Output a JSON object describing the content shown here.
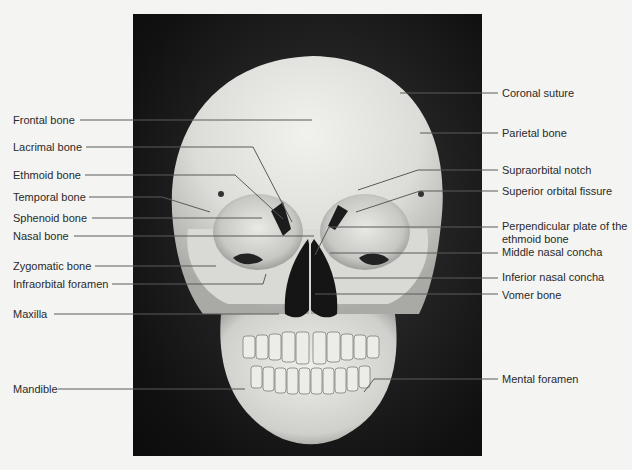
{
  "figure": {
    "photo": {
      "x": 133,
      "y": 14,
      "width": 349,
      "height": 442
    },
    "colors": {
      "background": "#f4f4f2",
      "text": "#2a2a2a",
      "leader": "#5a5a5a",
      "bone": "#e6e6e2",
      "photo_bg": "#161616"
    }
  },
  "labels_left": [
    {
      "id": "frontal",
      "text": "Frontal bone",
      "tx": 13,
      "ty": 114,
      "pts": [
        [
          80,
          120
        ],
        [
          312,
          120
        ]
      ]
    },
    {
      "id": "lacrimal",
      "text": "Lacrimal bone",
      "tx": 13,
      "ty": 141,
      "pts": [
        [
          86,
          147
        ],
        [
          253,
          147
        ],
        [
          292,
          222
        ]
      ]
    },
    {
      "id": "ethmoid",
      "text": "Ethmoid bone",
      "tx": 13,
      "ty": 169,
      "pts": [
        [
          85,
          175
        ],
        [
          235,
          175
        ],
        [
          283,
          219
        ]
      ]
    },
    {
      "id": "temporal",
      "text": "Temporal bone",
      "tx": 13,
      "ty": 191,
      "pts": [
        [
          89,
          197
        ],
        [
          162,
          197
        ],
        [
          210,
          212
        ]
      ]
    },
    {
      "id": "sphenoid",
      "text": "Sphenoid bone",
      "tx": 13,
      "ty": 212,
      "pts": [
        [
          92,
          218
        ],
        [
          262,
          218
        ]
      ]
    },
    {
      "id": "nasal",
      "text": "Nasal bone",
      "tx": 13,
      "ty": 230,
      "pts": [
        [
          74,
          236
        ],
        [
          314,
          236
        ]
      ]
    },
    {
      "id": "zygomatic",
      "text": "Zygomatic bone",
      "tx": 13,
      "ty": 260,
      "pts": [
        [
          95,
          266
        ],
        [
          216,
          266
        ]
      ]
    },
    {
      "id": "infraorbital",
      "text": "Infraorbital foramen",
      "tx": 13,
      "ty": 278,
      "pts": [
        [
          112,
          284
        ],
        [
          263,
          284
        ],
        [
          266,
          274
        ]
      ]
    },
    {
      "id": "maxilla",
      "text": "Maxilla",
      "tx": 13,
      "ty": 308,
      "pts": [
        [
          54,
          314
        ],
        [
          279,
          314
        ]
      ]
    },
    {
      "id": "mandible",
      "text": "Mandible",
      "tx": 13,
      "ty": 383,
      "pts": [
        [
          58,
          389
        ],
        [
          245,
          389
        ]
      ]
    }
  ],
  "labels_right": [
    {
      "id": "coronal",
      "text": "Coronal suture",
      "tx": 502,
      "ty": 87,
      "pts": [
        [
          498,
          93
        ],
        [
          400,
          93
        ]
      ]
    },
    {
      "id": "parietal",
      "text": "Parietal bone",
      "tx": 502,
      "ty": 127,
      "pts": [
        [
          498,
          133
        ],
        [
          420,
          133
        ]
      ]
    },
    {
      "id": "supraorbital",
      "text": "Supraorbital notch",
      "tx": 502,
      "ty": 164,
      "pts": [
        [
          498,
          170
        ],
        [
          418,
          170
        ],
        [
          358,
          190
        ]
      ]
    },
    {
      "id": "superior-orbital",
      "text": "Superior orbital fissure",
      "tx": 502,
      "ty": 185,
      "pts": [
        [
          498,
          191
        ],
        [
          420,
          191
        ],
        [
          356,
          212
        ]
      ]
    },
    {
      "id": "perpendicular",
      "text": "Perpendicular plate of the ethmoid bone",
      "tx": 502,
      "ty": 220,
      "pts": [
        [
          498,
          227
        ],
        [
          329,
          227
        ],
        [
          315,
          255
        ]
      ]
    },
    {
      "id": "middle-concha",
      "text": "Middle nasal concha",
      "tx": 502,
      "ty": 246,
      "pts": [
        [
          498,
          253
        ],
        [
          330,
          253
        ]
      ]
    },
    {
      "id": "inferior-concha",
      "text": "Inferior nasal concha",
      "tx": 502,
      "ty": 271,
      "pts": [
        [
          498,
          278
        ],
        [
          334,
          278
        ]
      ]
    },
    {
      "id": "vomer",
      "text": "Vomer bone",
      "tx": 502,
      "ty": 289,
      "pts": [
        [
          498,
          294
        ],
        [
          315,
          294
        ]
      ]
    },
    {
      "id": "mental",
      "text": "Mental foramen",
      "tx": 502,
      "ty": 373,
      "pts": [
        [
          498,
          379
        ],
        [
          374,
          379
        ],
        [
          364,
          392
        ]
      ]
    }
  ]
}
